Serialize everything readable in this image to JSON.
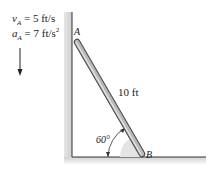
{
  "diagram": {
    "velocity": {
      "symbol": "v",
      "sub": "A",
      "value": " = 5 ft/s"
    },
    "acceleration": {
      "symbol": "a",
      "sub": "A",
      "value": " = 7 ft/s",
      "exp": "2"
    },
    "rod_length": "10 ft",
    "angle": "60°",
    "point_a": "A",
    "point_b": "B",
    "colors": {
      "rod": "#9a9a9a",
      "wall_shadow": "#d8d8d8",
      "line": "#333333"
    }
  }
}
